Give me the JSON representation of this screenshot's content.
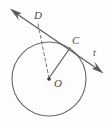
{
  "figure": {
    "kind": "circle-geometry-diagram",
    "background_color": "#fdfdfd",
    "stroke_color": "#5a5a5a",
    "label_color": "#4a4a4a",
    "labels": {
      "point_d": "D",
      "point_c": "C",
      "center_o": "O",
      "line_t": "t"
    },
    "icons": {
      "arrow_upper_left": "arrow-head-icon",
      "arrow_lower_right": "arrow-head-icon",
      "center_dot": "point-dot-icon"
    },
    "geometry": {
      "circle": {
        "cx": 49,
        "cy": 79,
        "r": 37
      },
      "points": {
        "D": {
          "x": 38,
          "y": 23
        },
        "C": {
          "x": 70,
          "y": 48
        },
        "O": {
          "x": 49,
          "y": 79
        }
      },
      "line_t": {
        "start": {
          "x": 11,
          "y": 10
        },
        "end": {
          "x": 102,
          "y": 72
        },
        "arrowheads": "both"
      },
      "segments": [
        {
          "name": "D-to-O",
          "style": "dashed",
          "from": "D",
          "to": "O"
        },
        {
          "name": "C-to-O",
          "style": "solid",
          "from": "C",
          "to": "O"
        }
      ]
    }
  }
}
